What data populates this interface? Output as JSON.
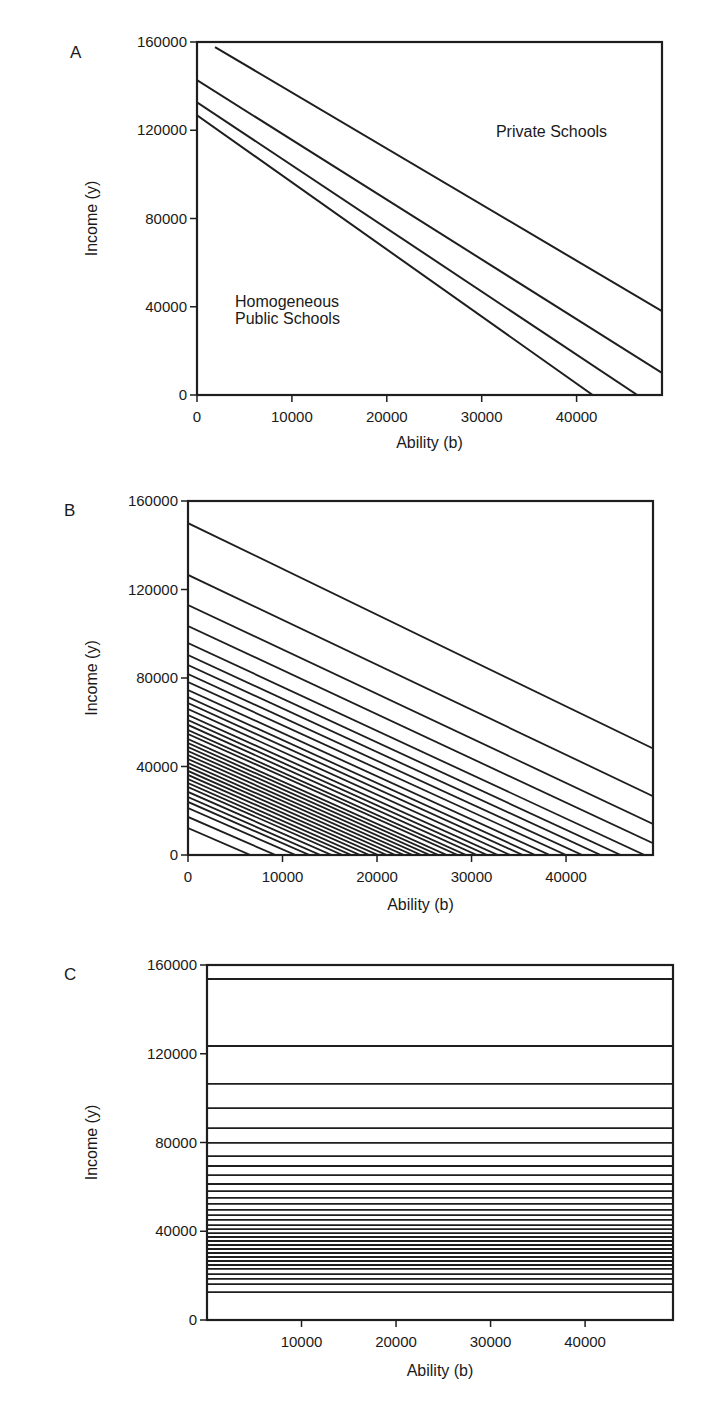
{
  "chart_data": [
    {
      "panel": "A",
      "type": "line",
      "xlabel": "Ability (b)",
      "ylabel": "Income (y)",
      "xlim": [
        0,
        49000
      ],
      "ylim": [
        0,
        160000
      ],
      "xticks": [
        0,
        10000,
        20000,
        30000,
        40000
      ],
      "yticks": [
        0,
        40000,
        80000,
        120000,
        160000
      ],
      "annotations": [
        {
          "text": "Private Schools",
          "x": 31500,
          "y": 117000
        },
        {
          "text": "Homogeneous",
          "x": 4000,
          "y": 40000
        },
        {
          "text": "Public Schools",
          "x": 4000,
          "y": 32000
        }
      ],
      "series": [
        {
          "name": "line-1",
          "points": [
            [
              1900,
              157700
            ],
            [
              49000,
              38000
            ]
          ]
        },
        {
          "name": "line-2",
          "points": [
            [
              0,
              142700
            ],
            [
              49000,
              10000
            ]
          ]
        },
        {
          "name": "line-3",
          "points": [
            [
              0,
              132700
            ],
            [
              46400,
              0
            ]
          ]
        },
        {
          "name": "line-4",
          "points": [
            [
              0,
              126800
            ],
            [
              41700,
              0
            ]
          ]
        }
      ]
    },
    {
      "panel": "B",
      "type": "line",
      "xlabel": "Ability (b)",
      "ylabel": "Income (y)",
      "xlim": [
        0,
        49200
      ],
      "ylim": [
        0,
        160000
      ],
      "xticks": [
        0,
        10000,
        20000,
        30000,
        40000
      ],
      "yticks": [
        0,
        40000,
        80000,
        120000,
        160000
      ],
      "slope_range": [
        1.85,
        2.07
      ],
      "intercepts": [
        150000,
        126600,
        113000,
        103500,
        95800,
        90400,
        85900,
        81800,
        78200,
        74600,
        71400,
        68700,
        66000,
        63300,
        61000,
        58800,
        56500,
        54700,
        52400,
        50600,
        48800,
        47000,
        45200,
        43400,
        41600,
        39800,
        38000,
        36200,
        34300,
        32500,
        30700,
        28500,
        26200,
        24000,
        21200,
        17200,
        12200
      ]
    },
    {
      "panel": "C",
      "type": "line",
      "xlabel": "Ability (b)",
      "ylabel": "Income (y)",
      "xlim": [
        0,
        49300
      ],
      "ylim": [
        0,
        160000
      ],
      "xticks": [
        10000,
        20000,
        30000,
        40000
      ],
      "yticks": [
        0,
        40000,
        80000,
        120000,
        160000
      ],
      "levels": [
        160000,
        153700,
        123500,
        106400,
        95500,
        86500,
        79800,
        73900,
        69400,
        65300,
        61300,
        58100,
        55000,
        52300,
        49600,
        47300,
        45100,
        42800,
        41000,
        39200,
        37400,
        35600,
        33800,
        32000,
        30200,
        28400,
        26600,
        24800,
        23000,
        20700,
        18500,
        16200,
        12600
      ]
    }
  ],
  "layout": {
    "panels": [
      {
        "letter": "A",
        "left": 197,
        "top": 42,
        "right": 662,
        "bottom": 395,
        "letter_x": 70,
        "letter_y": 58,
        "xlabel_y": 448
      },
      {
        "letter": "B",
        "left": 188,
        "top": 501,
        "right": 653,
        "bottom": 855,
        "letter_x": 64,
        "letter_y": 516,
        "xlabel_y": 910
      },
      {
        "letter": "C",
        "left": 207,
        "top": 965,
        "right": 673,
        "bottom": 1320,
        "letter_x": 64,
        "letter_y": 980,
        "xlabel_y": 1376
      }
    ],
    "line_color": "#1e1e1e"
  }
}
